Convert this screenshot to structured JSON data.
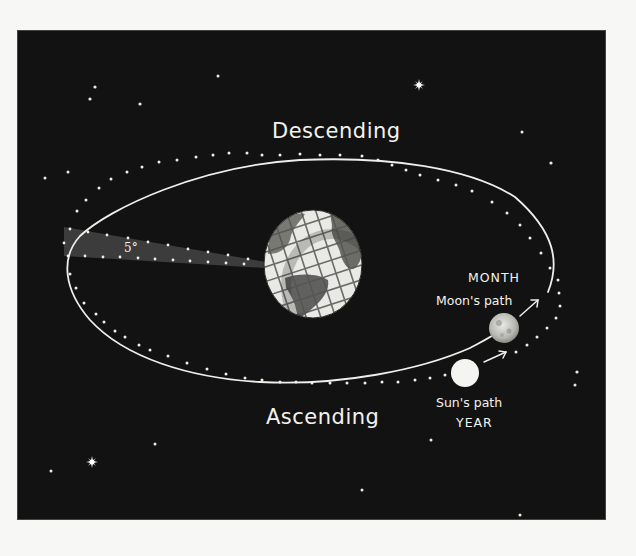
{
  "diagram": {
    "title_top": "Descending",
    "title_bottom": "Ascending",
    "angle_label": "5°",
    "moon_label_top": "MONTH",
    "moon_label": "Moon's path",
    "sun_label": "Sun's path",
    "sun_label_bottom": "YEAR",
    "colors": {
      "background": "#121212",
      "ink": "#f2f2ee",
      "wedge": "#3c3c3c",
      "page": "#f7f7f5"
    },
    "objects": [
      {
        "name": "Earth",
        "cx": 313,
        "cy": 264
      },
      {
        "name": "Moon",
        "cx": 504,
        "cy": 328
      },
      {
        "name": "Sun",
        "cx": 465,
        "cy": 373
      }
    ]
  }
}
